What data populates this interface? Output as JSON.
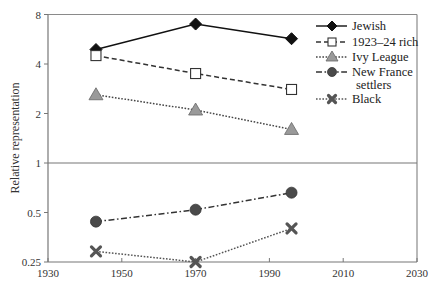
{
  "chart_data": {
    "type": "line",
    "title": "",
    "xlabel": "",
    "ylabel": "Relative representation",
    "xlim": [
      1930,
      2030
    ],
    "ylim": [
      0.25,
      8
    ],
    "yscale": "log2",
    "x_ticks": [
      "1930",
      "1950",
      "1970",
      "1990",
      "2010",
      "2030"
    ],
    "x_tick_values": [
      1930,
      1950,
      1970,
      1990,
      2010,
      2030
    ],
    "y_ticks": [
      "0.25",
      "0.5",
      "1",
      "2",
      "4",
      "8"
    ],
    "y_tick_values": [
      0.25,
      0.5,
      1,
      2,
      4,
      8
    ],
    "reference_line": {
      "y": 1
    },
    "grid": false,
    "legend_position": "upper right",
    "x": [
      1943,
      1970,
      1996
    ],
    "series": [
      {
        "name": "Jewish",
        "values": [
          4.9,
          7.0,
          5.7
        ],
        "marker": "diamond",
        "line": "solid",
        "color": "#111111",
        "fill": "#111111"
      },
      {
        "name": "1923–24 rich",
        "values": [
          4.5,
          3.5,
          2.8
        ],
        "marker": "square-open",
        "line": "dashed",
        "color": "#333333",
        "fill": "#ffffff"
      },
      {
        "name": "Ivy League",
        "values": [
          2.6,
          2.1,
          1.6
        ],
        "marker": "triangle",
        "line": "dotted",
        "color": "#444444",
        "fill": "#9a9a9a"
      },
      {
        "name": "New France settlers",
        "values": [
          0.44,
          0.52,
          0.66
        ],
        "marker": "circle",
        "line": "dash-dot",
        "color": "#333333",
        "fill": "#4a4a4a"
      },
      {
        "name": "Black",
        "values": [
          0.29,
          0.25,
          0.4
        ],
        "marker": "x",
        "line": "dotted",
        "color": "#555555",
        "fill": "#555555"
      }
    ]
  },
  "legend": {
    "items": [
      {
        "label_lines": [
          "Jewish"
        ]
      },
      {
        "label_lines": [
          "1923–24 rich"
        ]
      },
      {
        "label_lines": [
          "Ivy League"
        ]
      },
      {
        "label_lines": [
          "New France",
          "settlers"
        ]
      },
      {
        "label_lines": [
          "Black"
        ]
      }
    ]
  }
}
